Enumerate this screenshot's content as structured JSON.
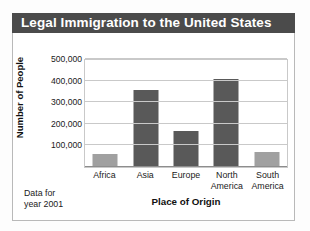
{
  "card": {
    "title": "Legal Immigration to the United States",
    "footnote_line1": "Data for",
    "footnote_line2": "year 2001"
  },
  "colors": {
    "title_bar_background": "#4b4b4b",
    "title_text": "#ffffff",
    "card_border": "#b9b9b9",
    "gridline": "#c9c9c9",
    "bar_dark": "#595959",
    "bar_light": "#a0a0a0",
    "plot_background": "#ffffff"
  },
  "chart_data": {
    "type": "bar",
    "title": "Legal Immigration to the United States",
    "xlabel": "Place of Origin",
    "ylabel": "Number of People",
    "categories": [
      "Africa",
      "Asia",
      "Europe",
      "North America",
      "South America"
    ],
    "category_lines": [
      [
        "Africa"
      ],
      [
        "Asia"
      ],
      [
        "Europe"
      ],
      [
        "North",
        "America"
      ],
      [
        "South",
        "America"
      ]
    ],
    "values": [
      55000,
      350000,
      160000,
      405000,
      65000
    ],
    "bar_colors": [
      "#a0a0a0",
      "#595959",
      "#595959",
      "#595959",
      "#a0a0a0"
    ],
    "ylim": [
      0,
      500000
    ],
    "yticks": [
      100000,
      200000,
      300000,
      400000,
      500000
    ],
    "ytick_labels": [
      "100,000",
      "200,000",
      "300,000",
      "400,000",
      "500,000"
    ],
    "grid": true,
    "legend": "none",
    "annotation": "Data for year 2001"
  }
}
